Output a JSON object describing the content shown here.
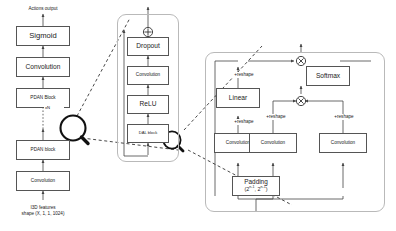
{
  "diagram": {
    "background": "#ffffff",
    "stroke": "#555555",
    "panel_stroke": "#b9b9b9"
  },
  "left_column": {
    "top_caption": "Actions output",
    "bottom_caption_line1": "I3D features",
    "bottom_caption_line2": "shape (X, 1, 1, 1024)",
    "repeat_label": "xN",
    "nodes": [
      {
        "label": "Sigmoid"
      },
      {
        "label": "Convolution"
      },
      {
        "label": "PDAN Block"
      },
      {
        "label": "PDAN block"
      },
      {
        "label": "Convolution"
      }
    ]
  },
  "middle_panel": {
    "add_operator": "⊕",
    "nodes": [
      {
        "label": "Dropout"
      },
      {
        "label": "Convolution"
      },
      {
        "label": "ReLU"
      },
      {
        "label": "DAL block"
      }
    ]
  },
  "right_panel": {
    "mul_operator_top": "⊗",
    "mul_operator_mid": "⊗",
    "reshape_label": "+reshape",
    "nodes": {
      "softmax": "Softmax",
      "linear": "Linear",
      "conv_left": "Convolution",
      "conv_mid": "Convolution",
      "conv_right": "Convolution",
      "padding_main": "Padding",
      "padding_sub_a": "2",
      "padding_sub_a_exp": "n-1",
      "padding_sub_b": "2",
      "padding_sub_b_exp": "n-1"
    }
  },
  "magnifiers": [
    {
      "name": "magnifier-left"
    },
    {
      "name": "magnifier-middle"
    }
  ]
}
